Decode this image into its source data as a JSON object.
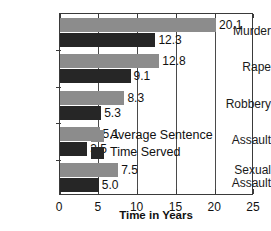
{
  "chart_data": {
    "type": "bar",
    "orientation": "horizontal",
    "title": "",
    "subtitle": "",
    "xlabel": "Time in Years",
    "ylabel": "",
    "xlim": [
      0,
      25
    ],
    "xticks": [
      0,
      5,
      10,
      15,
      20,
      25
    ],
    "xtick_labels": [
      "0",
      "5",
      "10",
      "15",
      "20",
      "25"
    ],
    "grid": true,
    "grid_axis": "x",
    "legend_position": "inside-lower-right",
    "categories": [
      "Murder",
      "Rape",
      "Robbery",
      "Assault",
      "Sexual\nAssault"
    ],
    "category_labels": [
      "Murder",
      "Rape",
      "Robbery",
      "Assault",
      "Sexual Assault"
    ],
    "series": [
      {
        "name": "Average Sentence",
        "color": "#8c8c8c",
        "values": [
          20.1,
          12.8,
          8.3,
          5.1,
          7.5
        ],
        "value_labels": [
          "20.1",
          "12.8",
          "8.3",
          "5.1",
          "7.5"
        ]
      },
      {
        "name": "Time Served",
        "color": "#262626",
        "values": [
          12.3,
          9.1,
          5.3,
          3.5,
          5.0
        ],
        "value_labels": [
          "12.3",
          "9.1",
          "5.3",
          "3.5",
          "5.0"
        ]
      }
    ]
  },
  "legend": {
    "items": [
      {
        "label": "Average Sentence",
        "color": "#8c8c8c"
      },
      {
        "label": "Time Served",
        "color": "#262626"
      }
    ]
  },
  "axis": {
    "x_title": "Time in Years",
    "x_tick_labels": [
      "0",
      "5",
      "10",
      "15",
      "20",
      "25"
    ]
  }
}
